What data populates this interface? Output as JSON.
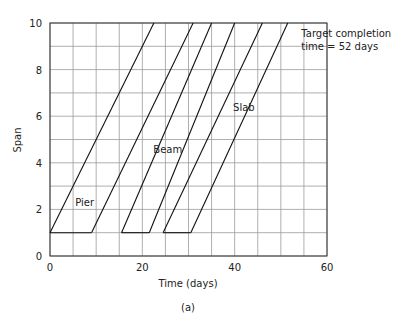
{
  "chart_data": {
    "type": "line",
    "title": "",
    "caption": "(a)",
    "xlabel": "Time (days)",
    "ylabel": "Span",
    "xlim": [
      0,
      60
    ],
    "ylim": [
      0,
      10
    ],
    "xticks": [
      0,
      20,
      40,
      60
    ],
    "yticks": [
      0,
      2,
      4,
      6,
      8,
      10
    ],
    "grid": {
      "x_step": 5,
      "y_step": 1,
      "on": true
    },
    "legend": null,
    "series": [
      {
        "name": "Pier",
        "points": [
          [
            0,
            1
          ],
          [
            22.5,
            10
          ]
        ]
      },
      {
        "name": "Pier",
        "points": [
          [
            9,
            1
          ],
          [
            31,
            10
          ]
        ]
      },
      {
        "name": "Beam",
        "points": [
          [
            15.5,
            1
          ],
          [
            35,
            10
          ]
        ]
      },
      {
        "name": "Beam",
        "points": [
          [
            21.5,
            1
          ],
          [
            40,
            10
          ]
        ]
      },
      {
        "name": "Slab",
        "points": [
          [
            24.5,
            1
          ],
          [
            46,
            10
          ]
        ]
      },
      {
        "name": "Slab",
        "points": [
          [
            30.5,
            1
          ],
          [
            51.5,
            10
          ]
        ]
      }
    ],
    "connectors": [
      {
        "points": [
          [
            0,
            1
          ],
          [
            9,
            1
          ]
        ]
      },
      {
        "points": [
          [
            15.5,
            1
          ],
          [
            21.5,
            1
          ]
        ]
      },
      {
        "points": [
          [
            24.5,
            1
          ],
          [
            30.5,
            1
          ]
        ]
      }
    ],
    "labels": [
      {
        "text": "Pier",
        "x": 7.5,
        "y": 2.3
      },
      {
        "text": "Beam",
        "x": 25.5,
        "y": 4.6
      },
      {
        "text": "Slab",
        "x": 42,
        "y": 6.4
      }
    ],
    "annotations": [
      {
        "lines": [
          "Target completion",
          "time = 52 days"
        ],
        "x": 54,
        "y": 9.4
      }
    ]
  }
}
